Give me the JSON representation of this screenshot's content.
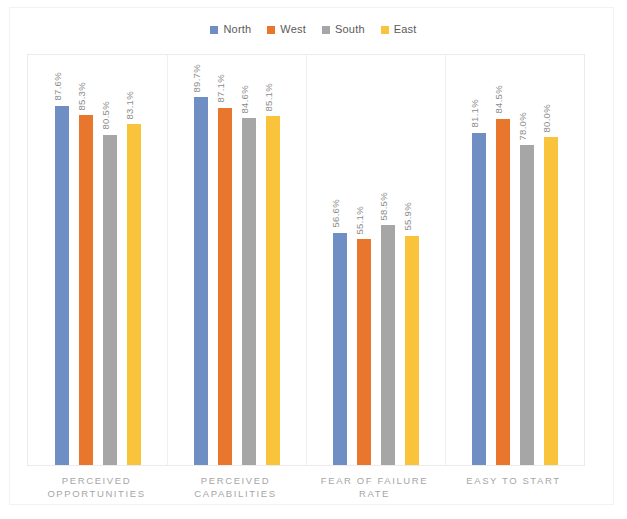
{
  "legend": {
    "items": [
      {
        "label": "North",
        "color": "#6f8fc4"
      },
      {
        "label": "West",
        "color": "#e8762c"
      },
      {
        "label": "South",
        "color": "#a6a6a6"
      },
      {
        "label": "East",
        "color": "#f9c33c"
      }
    ]
  },
  "axis": {
    "ymin": 0,
    "ymax": 100
  },
  "chart_data": {
    "type": "bar",
    "title": "",
    "xlabel": "",
    "ylabel": "",
    "ylim": [
      0,
      100
    ],
    "grid": false,
    "legend_position": "top",
    "value_suffix": "%",
    "categories": [
      "PERCEIVED OPPORTUNITIES",
      "PERCEIVED CAPABILITIES",
      "FEAR OF FAILURE RATE",
      "EASY TO START"
    ],
    "series": [
      {
        "name": "North",
        "color": "#6f8fc4",
        "values": [
          87.6,
          89.7,
          56.6,
          81.1
        ]
      },
      {
        "name": "West",
        "color": "#e8762c",
        "values": [
          85.3,
          87.1,
          55.1,
          84.5
        ]
      },
      {
        "name": "South",
        "color": "#a6a6a6",
        "values": [
          80.5,
          84.6,
          58.5,
          78.0
        ]
      },
      {
        "name": "East",
        "color": "#f9c33c",
        "values": [
          83.1,
          85.1,
          55.9,
          80.0
        ]
      }
    ],
    "data_labels": [
      [
        "87.6%",
        "85.3%",
        "80.5%",
        "83.1%"
      ],
      [
        "89.7%",
        "87.1%",
        "84.6%",
        "85.1%"
      ],
      [
        "56.6%",
        "55.1%",
        "58.5%",
        "55.9%"
      ],
      [
        "81.1%",
        "84.5%",
        "78.0%",
        "80.0%"
      ]
    ]
  }
}
